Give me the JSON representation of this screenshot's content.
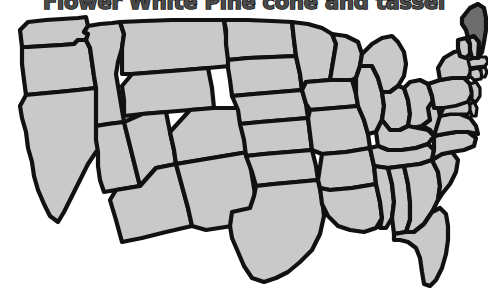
{
  "page": {
    "background_color": "#ffffff",
    "width": 488,
    "height": 304
  },
  "title": {
    "text": "Flower White Pine cone and tassel",
    "clipped": "top",
    "fill_color": "#4a4a4a",
    "outline_color": "#1a1a1a"
  },
  "map": {
    "name": "united-states-map",
    "state_fill_color": "#c9c9c9",
    "state_border_color": "#111111",
    "highlight_fill_color": "#6d6d6d",
    "highlighted_states": [
      "Maine"
    ],
    "states": [
      {
        "code": "WA",
        "name": "Washington",
        "highlighted": false
      },
      {
        "code": "OR",
        "name": "Oregon",
        "highlighted": false
      },
      {
        "code": "CA",
        "name": "California",
        "highlighted": false
      },
      {
        "code": "ID",
        "name": "Idaho",
        "highlighted": false
      },
      {
        "code": "NV",
        "name": "Nevada",
        "highlighted": false
      },
      {
        "code": "MT",
        "name": "Montana",
        "highlighted": false
      },
      {
        "code": "WY",
        "name": "Wyoming",
        "highlighted": false
      },
      {
        "code": "UT",
        "name": "Utah",
        "highlighted": false
      },
      {
        "code": "AZ",
        "name": "Arizona",
        "highlighted": false
      },
      {
        "code": "CO",
        "name": "Colorado",
        "highlighted": false
      },
      {
        "code": "NM",
        "name": "New Mexico",
        "highlighted": false
      },
      {
        "code": "ND",
        "name": "North Dakota",
        "highlighted": false
      },
      {
        "code": "SD",
        "name": "South Dakota",
        "highlighted": false
      },
      {
        "code": "NE",
        "name": "Nebraska",
        "highlighted": false
      },
      {
        "code": "KS",
        "name": "Kansas",
        "highlighted": false
      },
      {
        "code": "OK",
        "name": "Oklahoma",
        "highlighted": false
      },
      {
        "code": "TX",
        "name": "Texas",
        "highlighted": false
      },
      {
        "code": "MN",
        "name": "Minnesota",
        "highlighted": false
      },
      {
        "code": "IA",
        "name": "Iowa",
        "highlighted": false
      },
      {
        "code": "MO",
        "name": "Missouri",
        "highlighted": false
      },
      {
        "code": "AR",
        "name": "Arkansas",
        "highlighted": false
      },
      {
        "code": "LA",
        "name": "Louisiana",
        "highlighted": false
      },
      {
        "code": "WI",
        "name": "Wisconsin",
        "highlighted": false
      },
      {
        "code": "IL",
        "name": "Illinois",
        "highlighted": false
      },
      {
        "code": "MI",
        "name": "Michigan",
        "highlighted": false
      },
      {
        "code": "IN",
        "name": "Indiana",
        "highlighted": false
      },
      {
        "code": "OH",
        "name": "Ohio",
        "highlighted": false
      },
      {
        "code": "KY",
        "name": "Kentucky",
        "highlighted": false
      },
      {
        "code": "TN",
        "name": "Tennessee",
        "highlighted": false
      },
      {
        "code": "MS",
        "name": "Mississippi",
        "highlighted": false
      },
      {
        "code": "AL",
        "name": "Alabama",
        "highlighted": false
      },
      {
        "code": "GA",
        "name": "Georgia",
        "highlighted": false
      },
      {
        "code": "FL",
        "name": "Florida",
        "highlighted": false
      },
      {
        "code": "SC",
        "name": "South Carolina",
        "highlighted": false
      },
      {
        "code": "NC",
        "name": "North Carolina",
        "highlighted": false
      },
      {
        "code": "VA",
        "name": "Virginia",
        "highlighted": false
      },
      {
        "code": "WV",
        "name": "West Virginia",
        "highlighted": false
      },
      {
        "code": "MD",
        "name": "Maryland",
        "highlighted": false
      },
      {
        "code": "DE",
        "name": "Delaware",
        "highlighted": false
      },
      {
        "code": "PA",
        "name": "Pennsylvania",
        "highlighted": false
      },
      {
        "code": "NJ",
        "name": "New Jersey",
        "highlighted": false
      },
      {
        "code": "NY",
        "name": "New York",
        "highlighted": false
      },
      {
        "code": "CT",
        "name": "Connecticut",
        "highlighted": false
      },
      {
        "code": "RI",
        "name": "Rhode Island",
        "highlighted": false
      },
      {
        "code": "MA",
        "name": "Massachusetts",
        "highlighted": false
      },
      {
        "code": "VT",
        "name": "Vermont",
        "highlighted": false
      },
      {
        "code": "NH",
        "name": "New Hampshire",
        "highlighted": false
      },
      {
        "code": "ME",
        "name": "Maine",
        "highlighted": true
      }
    ]
  }
}
